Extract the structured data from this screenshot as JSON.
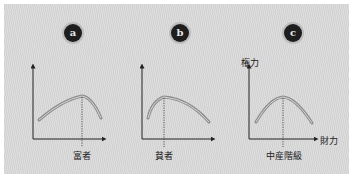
{
  "panels": [
    {
      "id": "a",
      "badge": "a",
      "x_marker_label": "富者",
      "peak_position": "right"
    },
    {
      "id": "b",
      "badge": "b",
      "x_marker_label": "貧者",
      "peak_position": "left"
    },
    {
      "id": "c",
      "badge": "c",
      "x_marker_label": "中産階級",
      "peak_position": "center",
      "y_axis_label": "権力",
      "x_axis_label": "財力"
    }
  ],
  "colors": {
    "background": "#d9d9d9",
    "curve": "#8c8c8c",
    "curve_highlight": "#d0d0d0",
    "axis": "#222222",
    "badge": "#1e1e1e"
  }
}
